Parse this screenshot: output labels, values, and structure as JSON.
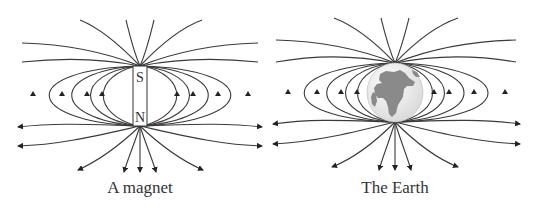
{
  "diagrams": [
    {
      "id": "magnet",
      "caption": "A magnet",
      "poles": {
        "top": "S",
        "bottom": "N"
      },
      "center_x": 140,
      "pole_top_y": 66,
      "pole_bottom_y": 126
    },
    {
      "id": "earth",
      "caption": "The Earth",
      "center_x": 395,
      "pole_top_y": 63,
      "pole_bottom_y": 122
    }
  ],
  "colors": {
    "line": "#3a3a3a",
    "globe_land": "#8a8a8a",
    "globe_ocean": "#f0f0f0"
  }
}
